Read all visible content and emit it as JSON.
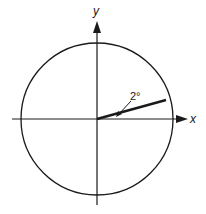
{
  "diagram": {
    "axis_labels": {
      "x": "x",
      "y": "y"
    },
    "angle_label": "2°",
    "colors": {
      "stroke": "#1a1a1a",
      "background": "#ffffff"
    },
    "elements": [
      {
        "type": "circle",
        "center": [
          97,
          119
        ],
        "radius": 76
      },
      {
        "type": "axis",
        "name": "x-axis",
        "from": [
          12,
          119
        ],
        "to": [
          185,
          119
        ]
      },
      {
        "type": "axis",
        "name": "y-axis",
        "from": [
          97,
          205
        ],
        "to": [
          97,
          22
        ]
      },
      {
        "type": "line",
        "name": "radius-vector",
        "from": [
          97,
          119
        ],
        "to": [
          166,
          100
        ],
        "weight": "thick"
      },
      {
        "type": "annotation",
        "text": "2°",
        "leader_from": [
          130,
          100
        ],
        "leader_to": [
          118,
          114
        ]
      }
    ]
  }
}
